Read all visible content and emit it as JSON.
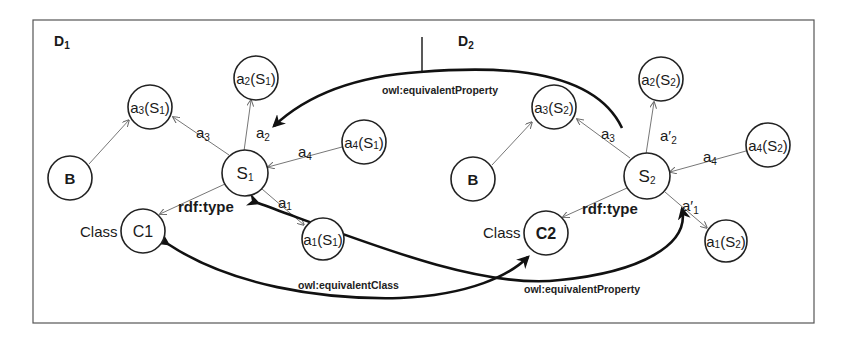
{
  "diagram": {
    "datasets": [
      {
        "id": "D1",
        "label": "D",
        "label_sub": "1",
        "nodes": {
          "a3": {
            "main": "a",
            "sub": "3",
            "arg": "S",
            "arg_sub": "1"
          },
          "a2": {
            "main": "a",
            "sub": "2",
            "arg": "S",
            "arg_sub": "1"
          },
          "a4": {
            "main": "a",
            "sub": "4",
            "arg": "S",
            "arg_sub": "1"
          },
          "a1": {
            "main": "a",
            "sub": "1",
            "arg": "S",
            "arg_sub": "1"
          },
          "B": "B",
          "S": {
            "main": "S",
            "sub": "1"
          },
          "C": "C1"
        },
        "class_label": "Class",
        "edge_labels": {
          "a3": {
            "main": "a",
            "sub": "3"
          },
          "a2": {
            "main": "a",
            "sub": "2"
          },
          "a4": {
            "main": "a",
            "sub": "4"
          },
          "a1": {
            "main": "a",
            "sub": "1"
          },
          "type": "rdf:type"
        }
      },
      {
        "id": "D2",
        "label": "D",
        "label_sub": "2",
        "nodes": {
          "a3": {
            "main": "a",
            "sub": "3",
            "arg": "S",
            "arg_sub": "2"
          },
          "a2": {
            "main": "a",
            "sub": "2",
            "arg": "S",
            "arg_sub": "2"
          },
          "a4": {
            "main": "a",
            "sub": "4",
            "arg": "S",
            "arg_sub": "2"
          },
          "a1": {
            "main": "a",
            "sub": "1",
            "arg": "S",
            "arg_sub": "2"
          },
          "B": "B",
          "S": {
            "main": "S",
            "sub": "2"
          },
          "C": "C2"
        },
        "class_label": "Class",
        "edge_labels": {
          "a3": {
            "main": "a",
            "sub": "3"
          },
          "a2": {
            "main": "a′",
            "sub": "2"
          },
          "a4": {
            "main": "a",
            "sub": "4"
          },
          "a1": {
            "main": "a′",
            "sub": "1"
          },
          "type": "rdf:type"
        }
      }
    ],
    "mappings": {
      "top_property": "owl:equivalentProperty",
      "class": "owl:equivalentClass",
      "bottom_property": "owl:equivalentProperty"
    },
    "colors": {
      "stroke": "#222222",
      "thin_edge": "#777777",
      "mapping_edge": "#111111"
    }
  }
}
